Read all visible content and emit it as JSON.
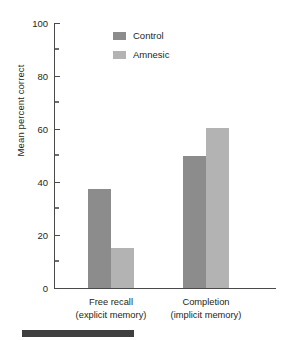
{
  "chart_data": {
    "type": "bar",
    "title": "",
    "xlabel": "",
    "ylabel": "Mean percent correct",
    "ylim": [
      0,
      100
    ],
    "yticks": [
      0,
      20,
      40,
      60,
      80,
      100
    ],
    "ytick_labels": [
      "0",
      "20",
      "40",
      "60",
      "80",
      "100"
    ],
    "yminor_ticks": [
      10,
      30,
      50,
      70,
      90
    ],
    "grid": false,
    "legend_position": "top-center",
    "categories": [
      "Free recall\n(explicit memory)",
      "Completion\n(implicit memory)"
    ],
    "category_lines": [
      {
        "line1": "Free recall",
        "line2": "(explicit memory)"
      },
      {
        "line1": "Completion",
        "line2": "(implicit memory)"
      }
    ],
    "series": [
      {
        "name": "Control",
        "color": "#8c8c8c",
        "values": [
          37.5,
          50
        ]
      },
      {
        "name": "Amnesic",
        "color": "#b3b3b3",
        "values": [
          15,
          60.5
        ]
      }
    ]
  },
  "axis": {
    "color": "#4a4a4a"
  },
  "legend": {
    "items": [
      {
        "label": "Control",
        "color": "#8c8c8c",
        "swatch_name": "legend-swatch-control"
      },
      {
        "label": "Amnesic",
        "color": "#b3b3b3",
        "swatch_name": "legend-swatch-amnesic"
      }
    ]
  },
  "artifact": {
    "name": "scan-edge-bar",
    "color": "#3f3f3f"
  }
}
